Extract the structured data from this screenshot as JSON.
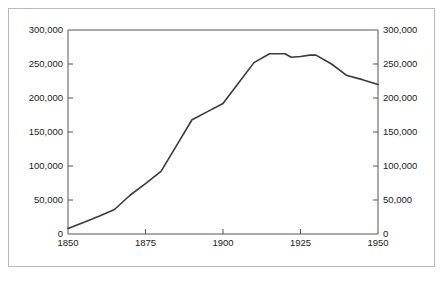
{
  "chart_data": {
    "type": "line",
    "title": "",
    "subtitle": "",
    "xlabel": "",
    "ylabel": "",
    "xlim": [
      1850,
      1950
    ],
    "ylim": [
      0,
      300000
    ],
    "grid": false,
    "legend": null,
    "annotations": [],
    "axes": {
      "left": {
        "ticks": [
          0,
          50000,
          100000,
          150000,
          200000,
          250000,
          300000
        ],
        "tick_labels": [
          "0",
          "50,000",
          "100,000",
          "150,000",
          "200,000",
          "250,000",
          "300,000"
        ]
      },
      "right": {
        "ticks": [
          0,
          50000,
          100000,
          150000,
          200000,
          250000,
          300000
        ],
        "tick_labels": [
          "0",
          "50,000",
          "100,000",
          "150,000",
          "200,000",
          "250,000",
          "300,000"
        ]
      },
      "bottom": {
        "ticks": [
          1850,
          1875,
          1900,
          1925,
          1950
        ],
        "tick_labels": [
          "1850",
          "1875",
          "1900",
          "1925",
          "1950"
        ]
      }
    },
    "series": [
      {
        "name": "population",
        "x": [
          1850,
          1855,
          1860,
          1865,
          1870,
          1875,
          1880,
          1885,
          1890,
          1895,
          1900,
          1905,
          1910,
          1915,
          1920,
          1922,
          1925,
          1928,
          1930,
          1935,
          1940,
          1945,
          1950
        ],
        "values": [
          8000,
          17000,
          26000,
          36000,
          57000,
          74000,
          92000,
          130000,
          168000,
          180000,
          192000,
          222000,
          252000,
          265000,
          265000,
          260000,
          261000,
          263000,
          263000,
          250000,
          233000,
          227000,
          220000
        ]
      }
    ],
    "line_color": "#3a3a3a",
    "axis_color": "#555555",
    "frame_color": "#b9b9b9",
    "background_color": "#ffffff"
  }
}
